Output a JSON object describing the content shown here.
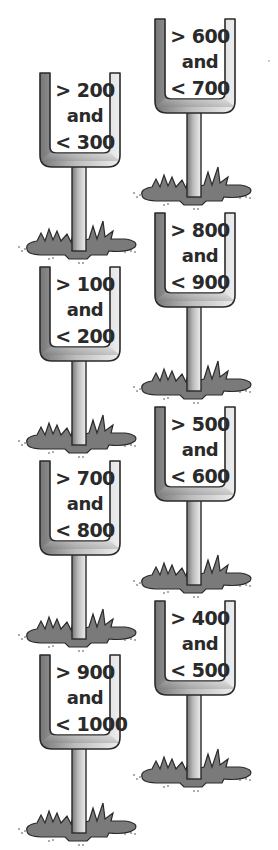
{
  "colors": {
    "post_light": "#e4e4e4",
    "post_dark": "#8a8a8a",
    "outline": "#2a2a2a",
    "grass": "#7a7a7a",
    "text": "#2a2a2a"
  },
  "goalposts": [
    {
      "column": "left",
      "top": 2,
      "line1": "> 200",
      "line2": "and",
      "line3": "< 300"
    },
    {
      "column": "left",
      "top": 3,
      "line1": "> 100",
      "line2": "and",
      "line3": "< 200"
    },
    {
      "column": "left",
      "top": 4,
      "line1": "> 700",
      "line2": "and",
      "line3": "< 800"
    },
    {
      "column": "left",
      "top": 5,
      "line1": "> 900",
      "line2": "and",
      "line3": "< 1000"
    },
    {
      "column": "right",
      "top": 0,
      "line1": "> 600",
      "line2": "and",
      "line3": "< 700"
    },
    {
      "column": "right",
      "top": 1,
      "line1": "> 800",
      "line2": "and",
      "line3": "< 900"
    },
    {
      "column": "right",
      "top": 2,
      "line1": "> 500",
      "line2": "and",
      "line3": "< 600"
    },
    {
      "column": "right",
      "top": 3,
      "line1": "> 400",
      "line2": "and",
      "line3": "< 500"
    }
  ]
}
